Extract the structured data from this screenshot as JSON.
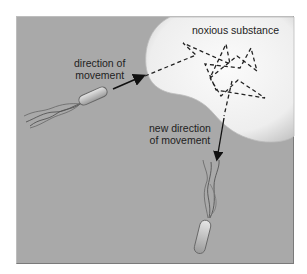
{
  "figure": {
    "labels": {
      "noxious": "noxious substance",
      "direction_line1": "direction of",
      "direction_line2": "movement",
      "new_direction_line1": "new direction",
      "new_direction_line2": "of movement"
    },
    "colors": {
      "background": "#a9a9a9",
      "substance": "#f2f2f2",
      "path": "#222222",
      "bacterium_body": "#c8c8c8",
      "flagella": "#555555"
    }
  }
}
